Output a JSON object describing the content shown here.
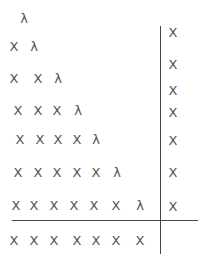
{
  "diagram": {
    "symbols": {
      "cross": "X",
      "lambda": "λ"
    },
    "rows": [
      [
        "λ"
      ],
      [
        "X",
        "λ"
      ],
      [
        "X",
        "X",
        "λ"
      ],
      [
        "X",
        "X",
        "X",
        "λ"
      ],
      [
        "X",
        "X",
        "X",
        "X",
        "λ"
      ],
      [
        "X",
        "X",
        "X",
        "X",
        "X",
        "λ"
      ],
      [
        "X",
        "X",
        "X",
        "X",
        "X",
        "X",
        "λ"
      ],
      [
        "X",
        "X",
        "X",
        "X",
        "X",
        "X",
        "X"
      ]
    ],
    "right_column": [
      "X",
      "X",
      "X",
      "X",
      "X",
      "X",
      "X"
    ],
    "separators": {
      "vertical_x": 160,
      "horizontal_y": 220
    }
  }
}
